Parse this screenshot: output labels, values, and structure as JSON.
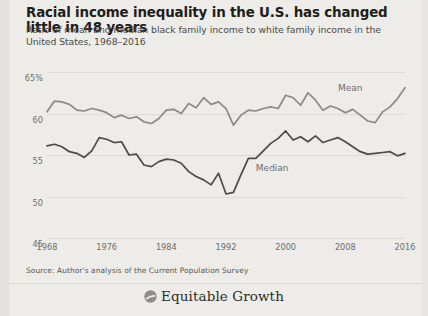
{
  "title": "Racial income inequality in the U.S. has changed little in 48 years",
  "subtitle": "Ratio of mean and median black family income to white family income in the United States, 1968–2016",
  "source": "Source: Author's analysis of the Current Population Survey",
  "brand": {
    "name": "Equitable Growth",
    "logo_icon": "circle-swoosh-logo-icon"
  },
  "colors": {
    "background": "#edece9",
    "mean_line": "#8a8a86",
    "median_line": "#4b4b49",
    "gridline": "#dcdbd6",
    "title_text": "#1d1d1b",
    "axis_text": "#6d6c68"
  },
  "chart_data": {
    "type": "line",
    "title": "Racial income inequality in the U.S. has changed little in 48 years",
    "subtitle": "Ratio of mean and median black family income to white family income in the United States, 1968–2016",
    "xlabel": "",
    "ylabel": "",
    "xlim": [
      1968,
      2016
    ],
    "ylim": [
      45,
      65
    ],
    "grid": true,
    "legend": "inline-labels",
    "y_ticks": [
      65,
      60,
      55,
      50,
      45
    ],
    "y_tick_labels": [
      "65%",
      "60",
      "55",
      "50",
      "45"
    ],
    "x_ticks": [
      1968,
      1976,
      1984,
      1992,
      2000,
      2008,
      2016
    ],
    "x_tick_labels": [
      "1968",
      "1976",
      "1984",
      "1992",
      "2000",
      "2008",
      "2016"
    ],
    "x": [
      1968,
      1969,
      1970,
      1971,
      1972,
      1973,
      1974,
      1975,
      1976,
      1977,
      1978,
      1979,
      1980,
      1981,
      1982,
      1983,
      1984,
      1985,
      1986,
      1987,
      1988,
      1989,
      1990,
      1991,
      1992,
      1993,
      1994,
      1995,
      1996,
      1997,
      1998,
      1999,
      2000,
      2001,
      2002,
      2003,
      2004,
      2005,
      2006,
      2007,
      2008,
      2009,
      2010,
      2011,
      2012,
      2013,
      2014,
      2015,
      2016
    ],
    "series": [
      {
        "name": "Mean",
        "color": "#8a8a86",
        "label_x": 2007,
        "label_y": 63.0,
        "values": [
          60.2,
          61.5,
          61.4,
          61.1,
          60.4,
          60.3,
          60.6,
          60.4,
          60.1,
          59.5,
          59.8,
          59.4,
          59.6,
          59.0,
          58.8,
          59.4,
          60.4,
          60.5,
          60.0,
          61.2,
          60.7,
          61.9,
          61.1,
          61.4,
          60.6,
          58.6,
          59.8,
          60.4,
          60.3,
          60.6,
          60.8,
          60.6,
          62.2,
          61.9,
          61.0,
          62.5,
          61.6,
          60.4,
          60.9,
          60.6,
          60.1,
          60.5,
          59.8,
          59.1,
          58.9,
          60.2,
          60.8,
          61.8,
          63.1
        ]
      },
      {
        "name": "Median",
        "color": "#4b4b49",
        "label_x": 1996,
        "label_y": 53.3,
        "values": [
          56.1,
          56.3,
          56.0,
          55.4,
          55.2,
          54.7,
          55.5,
          57.1,
          56.9,
          56.5,
          56.6,
          55.0,
          55.1,
          53.8,
          53.6,
          54.2,
          54.5,
          54.4,
          54.0,
          53.0,
          52.4,
          52.0,
          51.4,
          52.8,
          50.3,
          50.5,
          52.6,
          54.6,
          54.6,
          55.5,
          56.4,
          57.0,
          57.9,
          56.8,
          57.2,
          56.6,
          57.3,
          56.5,
          56.8,
          57.1,
          56.6,
          56.0,
          55.4,
          55.1,
          55.2,
          55.3,
          55.4,
          54.9,
          55.2
        ]
      }
    ]
  }
}
